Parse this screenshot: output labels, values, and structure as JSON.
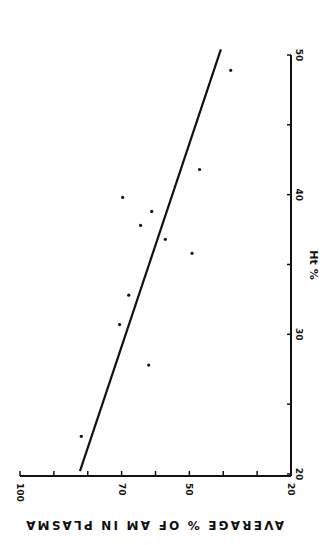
{
  "chart_data": {
    "type": "scatter",
    "title": "",
    "xlabel": "Ht %",
    "ylabel": "AVERAGE % OF AM IN PLASMA",
    "xlim": [
      20,
      50
    ],
    "ylim": [
      20,
      100
    ],
    "x_ticks": [
      20,
      30,
      40,
      50
    ],
    "x_minor_ticks": [
      25,
      35,
      45
    ],
    "y_ticks": [
      100,
      70,
      50,
      20
    ],
    "y_minor_ticks": [
      90,
      80,
      60,
      40,
      30
    ],
    "grid": false,
    "legend": null,
    "orientation_note": "figure rotated 90 degrees clockwise",
    "series": [
      {
        "name": "observations",
        "kind": "points",
        "x": [
          22.7,
          27.8,
          30.7,
          32.8,
          35.8,
          36.8,
          37.8,
          38.8,
          39.8,
          41.8,
          48.9
        ],
        "y": [
          81.9,
          62.0,
          70.6,
          67.9,
          49.2,
          57.1,
          64.4,
          61.1,
          69.7,
          47.0,
          37.8
        ]
      },
      {
        "name": "regression line",
        "kind": "line",
        "x": [
          20.2,
          50.4
        ],
        "y": [
          82.3,
          40.7
        ]
      }
    ]
  },
  "labels": {
    "x_axis_title": "Ht %",
    "y_axis_title": "AVERAGE %  OF AM IN PLASMA",
    "x_tick_labels": [
      "20",
      "30",
      "40",
      "50"
    ],
    "y_tick_labels": [
      "100",
      "70",
      "50",
      "20"
    ]
  }
}
